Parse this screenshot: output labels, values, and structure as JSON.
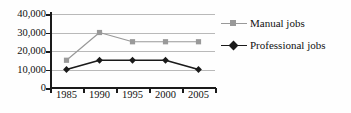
{
  "chart_data": {
    "type": "line",
    "title": "",
    "xlabel": "",
    "ylabel": "",
    "categories": [
      "1985",
      "1990",
      "1995",
      "2000",
      "2005"
    ],
    "ylim": [
      0,
      40000
    ],
    "yticks": [
      0,
      10000,
      20000,
      30000,
      40000
    ],
    "ytick_labels": [
      "0",
      "10,000",
      "20,000",
      "30,000",
      "40,000"
    ],
    "grid": "horizontal",
    "legend_position": "right",
    "series": [
      {
        "name": "Manual jobs",
        "values": [
          15000,
          30000,
          25000,
          25000,
          25000
        ],
        "color": "#999999",
        "marker": "square"
      },
      {
        "name": "Professional jobs",
        "values": [
          10000,
          15000,
          15000,
          15000,
          10000
        ],
        "color": "#1a1a1a",
        "marker": "diamond"
      }
    ]
  },
  "colors": {
    "background": "#fefefe",
    "axis": "#1a1a1a",
    "gridline": "#b9b9b9",
    "manual": "#999999",
    "professional": "#1a1a1a",
    "text": "#111111"
  }
}
